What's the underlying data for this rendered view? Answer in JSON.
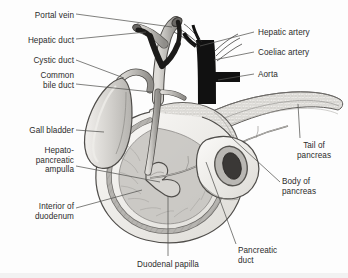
{
  "figure": {
    "background_color": "#fdfdfd",
    "label_color": "#2c2c2c",
    "leader_line_color": "#555555",
    "aorta_color": "#111111",
    "pancreas_color": "#e6e4e0",
    "duodenum_color": "#f0eeea",
    "gallbladder_color": "#cfcdc9",
    "duct_color": "#b8b6b2"
  },
  "labels": {
    "left": [
      {
        "id": "portal-vein",
        "text": "Portal vein",
        "lines": [
          "Portal vein"
        ],
        "x": 8,
        "y": 11,
        "w": 66
      },
      {
        "id": "hepatic-duct",
        "text": "Hepatic duct",
        "lines": [
          "Hepatic duct"
        ],
        "x": 4,
        "y": 36,
        "w": 70
      },
      {
        "id": "cystic-duct",
        "text": "Cystic duct",
        "lines": [
          "Cystic duct"
        ],
        "x": 8,
        "y": 57,
        "w": 66
      },
      {
        "id": "common-bile-duct",
        "text": "Common bile duct",
        "lines": [
          "Common",
          "bile duct"
        ],
        "x": 8,
        "y": 73,
        "w": 66
      },
      {
        "id": "gall-bladder",
        "text": "Gall bladder",
        "lines": [
          "Gall bladder"
        ],
        "x": 4,
        "y": 127,
        "w": 70
      },
      {
        "id": "hepatopancreatic-ampulla",
        "text": "Hepato-pancreatic ampulla",
        "lines": [
          "Hepato-",
          "pancreatic",
          "ampulla"
        ],
        "x": 8,
        "y": 148,
        "w": 66
      },
      {
        "id": "interior-of-duodenum",
        "text": "Interior of duodenum",
        "lines": [
          "Interior of",
          "duodenum"
        ],
        "x": 8,
        "y": 203,
        "w": 66
      }
    ],
    "right": [
      {
        "id": "hepatic-artery",
        "text": "Hepatic artery",
        "lines": [
          "Hepatic artery"
        ],
        "x": 258,
        "y": 29
      },
      {
        "id": "coeliac-artery",
        "text": "Coeliac artery",
        "lines": [
          "Coeliac artery"
        ],
        "x": 258,
        "y": 49
      },
      {
        "id": "aorta",
        "text": "Aorta",
        "lines": [
          "Aorta"
        ],
        "x": 258,
        "y": 71
      },
      {
        "id": "tail-of-pancreas",
        "text": "Tail of pancreas",
        "lines": [
          "Tail of",
          "pancreas"
        ],
        "x": 293,
        "y": 142
      },
      {
        "id": "body-of-pancreas",
        "text": "Body of pancreas",
        "lines": [
          "Body of",
          "pancreas"
        ],
        "x": 283,
        "y": 178
      }
    ],
    "bottom": [
      {
        "id": "duodenal-papilla",
        "text": "Duodenal papilla",
        "lines": [
          "Duodenal papilla"
        ],
        "x": 125,
        "y": 261
      },
      {
        "id": "pancreatic-duct",
        "text": "Pancreatic duct",
        "lines": [
          "Pancreatic",
          "duct"
        ],
        "x": 238,
        "y": 247
      }
    ]
  }
}
